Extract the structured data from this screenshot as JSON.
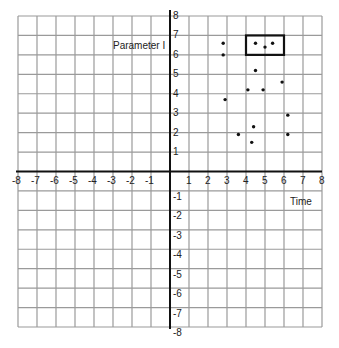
{
  "chart_data": {
    "type": "scatter",
    "title": "",
    "xlabel": "Time",
    "ylabel": "Parameter I",
    "xlim": [
      -8,
      8
    ],
    "ylim": [
      -8,
      8
    ],
    "grid": true,
    "x_ticks": [
      -8,
      -7,
      -6,
      -5,
      -4,
      -3,
      -2,
      -1,
      1,
      2,
      3,
      4,
      5,
      6,
      7,
      8
    ],
    "y_ticks": [
      -8,
      -7,
      -6,
      -5,
      -4,
      -3,
      -2,
      -1,
      1,
      2,
      3,
      4,
      5,
      6,
      7,
      8
    ],
    "points": [
      {
        "x": 2.8,
        "y": 6.6
      },
      {
        "x": 2.8,
        "y": 6.0
      },
      {
        "x": 4.5,
        "y": 6.6
      },
      {
        "x": 5.0,
        "y": 6.4
      },
      {
        "x": 5.4,
        "y": 6.6
      },
      {
        "x": 4.5,
        "y": 5.2
      },
      {
        "x": 5.9,
        "y": 4.6
      },
      {
        "x": 4.1,
        "y": 4.2
      },
      {
        "x": 4.9,
        "y": 4.2
      },
      {
        "x": 2.9,
        "y": 3.7
      },
      {
        "x": 6.2,
        "y": 2.9
      },
      {
        "x": 4.4,
        "y": 2.3
      },
      {
        "x": 3.6,
        "y": 1.9
      },
      {
        "x": 6.2,
        "y": 1.9
      },
      {
        "x": 4.3,
        "y": 1.5
      }
    ],
    "annotations": [
      {
        "type": "rectangle",
        "x0": 4,
        "x1": 6,
        "y0": 6,
        "y1": 7
      }
    ]
  },
  "labels": {
    "y_axis_label": "Parameter I",
    "x_axis_label": "Time"
  },
  "colors": {
    "grid": "#9a9a9a",
    "axis": "#111111",
    "point": "#111111",
    "highlight_box": "#111111"
  }
}
